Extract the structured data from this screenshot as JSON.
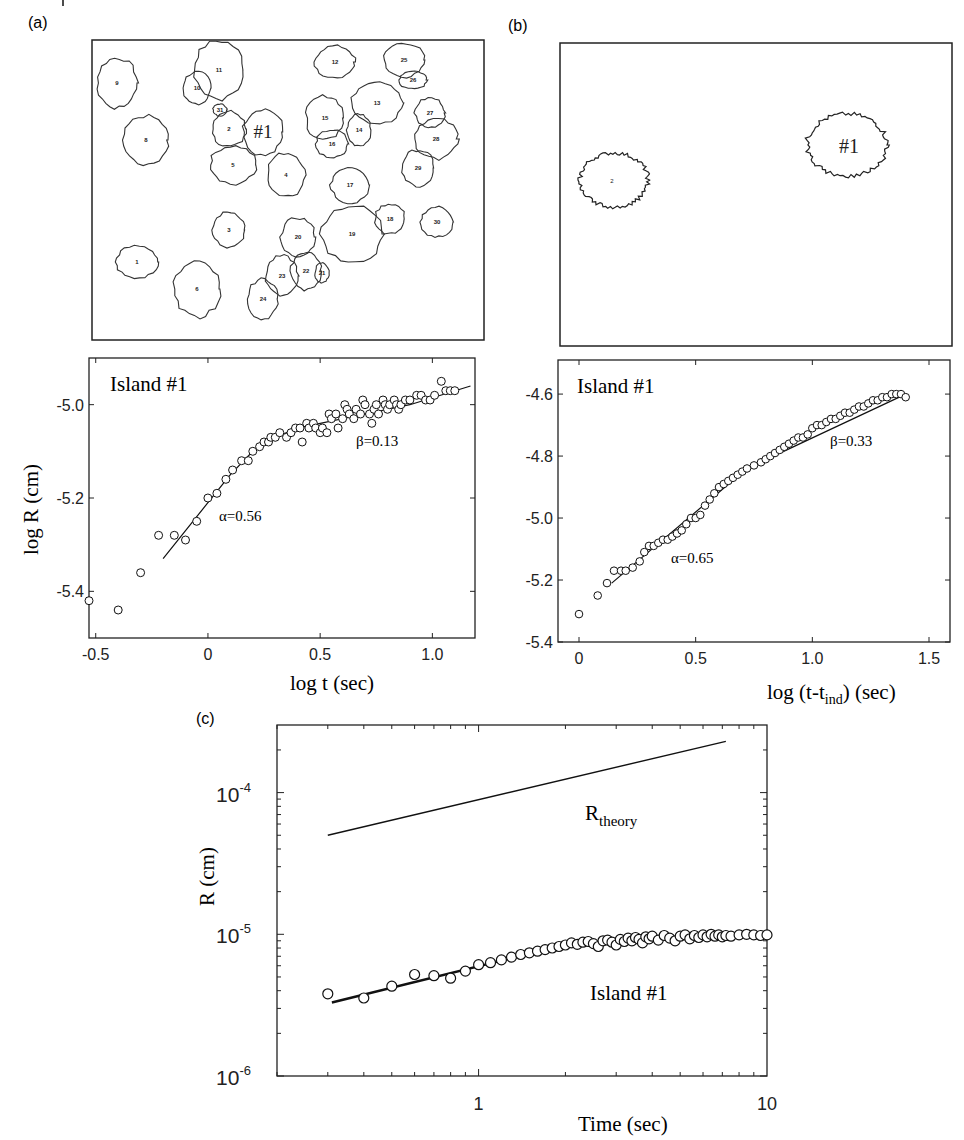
{
  "figure": {
    "panel_labels": [
      "(a)",
      "(b)",
      "(c)"
    ]
  },
  "chart_data": [
    {
      "id": "a-map",
      "type": "diagram",
      "title": "Island outlines (early)",
      "islands": [
        {
          "label": "9"
        },
        {
          "label": "11"
        },
        {
          "label": "10"
        },
        {
          "label": "31"
        },
        {
          "label": "2"
        },
        {
          "label": "#1"
        },
        {
          "label": "8"
        },
        {
          "label": "5"
        },
        {
          "label": "4"
        },
        {
          "label": "12"
        },
        {
          "label": "25"
        },
        {
          "label": "26"
        },
        {
          "label": "15"
        },
        {
          "label": "13"
        },
        {
          "label": "14"
        },
        {
          "label": "16"
        },
        {
          "label": "27"
        },
        {
          "label": "28"
        },
        {
          "label": "29"
        },
        {
          "label": "17"
        },
        {
          "label": "3"
        },
        {
          "label": "20"
        },
        {
          "label": "19"
        },
        {
          "label": "18"
        },
        {
          "label": "30"
        },
        {
          "label": "1"
        },
        {
          "label": "6"
        },
        {
          "label": "23"
        },
        {
          "label": "22"
        },
        {
          "label": "21"
        },
        {
          "label": "24"
        }
      ]
    },
    {
      "id": "b-map",
      "type": "diagram",
      "title": "Island outlines (later)",
      "islands": [
        {
          "label": "2"
        },
        {
          "label": "#1"
        }
      ]
    },
    {
      "id": "a-plot",
      "type": "scatter",
      "annotation": "Island #1",
      "xlabel": "log t (sec)",
      "ylabel": "log R (cm)",
      "xlim": [
        -0.53,
        1.19
      ],
      "ylim": [
        -5.5,
        -4.9
      ],
      "xticks": [
        -0.5,
        0,
        0.5,
        1.0
      ],
      "xtick_labels": [
        "-0.5",
        "0",
        "0.5",
        "1.0"
      ],
      "yticks": [
        -5.0,
        -5.2,
        -5.4
      ],
      "ytick_labels": [
        "-5.0",
        "-5.2",
        "-5.4"
      ],
      "fits": [
        {
          "label": "α=0.56",
          "x": [
            -0.2,
            0.3
          ],
          "y": [
            -5.33,
            -5.07
          ]
        },
        {
          "label": "β=0.13",
          "x": [
            0.3,
            1.17
          ],
          "y": [
            -5.07,
            -4.96
          ]
        }
      ],
      "fit_curve": {
        "x": [
          -0.2,
          0.0,
          0.1,
          0.2,
          0.3,
          0.4,
          0.5,
          0.7,
          0.9,
          1.17
        ],
        "y": [
          -5.33,
          -5.21,
          -5.15,
          -5.1,
          -5.07,
          -5.05,
          -5.04,
          -5.02,
          -5.0,
          -4.96
        ]
      },
      "series": [
        {
          "name": "Island #1",
          "x": [
            -0.53,
            -0.4,
            -0.3,
            -0.22,
            -0.15,
            -0.1,
            -0.05,
            0.0,
            0.04,
            0.08,
            0.11,
            0.15,
            0.18,
            0.2,
            0.23,
            0.25,
            0.27,
            0.28,
            0.3,
            0.32,
            0.35,
            0.37,
            0.39,
            0.41,
            0.42,
            0.44,
            0.45,
            0.47,
            0.48,
            0.5,
            0.51,
            0.53,
            0.54,
            0.55,
            0.57,
            0.58,
            0.6,
            0.61,
            0.62,
            0.63,
            0.65,
            0.66,
            0.68,
            0.69,
            0.7,
            0.72,
            0.73,
            0.74,
            0.75,
            0.76,
            0.78,
            0.79,
            0.8,
            0.81,
            0.83,
            0.84,
            0.85,
            0.86,
            0.88,
            0.9,
            0.93,
            0.95,
            0.97,
            0.99,
            1.01,
            1.04,
            1.06,
            1.08,
            1.1
          ],
          "y": [
            -5.42,
            -5.44,
            -5.36,
            -5.28,
            -5.28,
            -5.29,
            -5.25,
            -5.2,
            -5.19,
            -5.16,
            -5.14,
            -5.12,
            -5.12,
            -5.1,
            -5.09,
            -5.08,
            -5.08,
            -5.07,
            -5.07,
            -5.06,
            -5.07,
            -5.06,
            -5.05,
            -5.05,
            -5.08,
            -5.04,
            -5.05,
            -5.04,
            -5.05,
            -5.06,
            -5.05,
            -5.06,
            -5.02,
            -5.03,
            -5.02,
            -5.05,
            -5.03,
            -5.0,
            -5.01,
            -5.02,
            -5.03,
            -5.01,
            -5.02,
            -4.99,
            -5.0,
            -5.02,
            -5.04,
            -5.01,
            -5.0,
            -5.02,
            -4.99,
            -5.0,
            -5.01,
            -5.0,
            -4.99,
            -5.0,
            -5.01,
            -5.0,
            -4.99,
            -4.99,
            -4.98,
            -4.98,
            -4.99,
            -4.99,
            -4.98,
            -4.95,
            -4.97,
            -4.97,
            -4.97
          ]
        }
      ]
    },
    {
      "id": "b-plot",
      "type": "scatter",
      "annotation": "Island #1",
      "xlabel_main": "log (t-t",
      "xlabel_sub": "ind",
      "xlabel_tail": ") (sec)",
      "xlim": [
        -0.09,
        1.59
      ],
      "ylim": [
        -5.4,
        -4.49
      ],
      "xticks": [
        0,
        0.5,
        1.0,
        1.5
      ],
      "xtick_labels": [
        "0",
        "0.5",
        "1.0",
        "1.5"
      ],
      "yticks": [
        -4.6,
        -4.8,
        -5.0,
        -5.2,
        -5.4
      ],
      "ytick_labels": [
        "-4.6",
        "-4.8",
        "-5.0",
        "-5.2",
        "-5.4"
      ],
      "fits": [
        {
          "label": "α=0.65",
          "x": [
            0.14,
            0.72
          ],
          "y": [
            -5.21,
            -4.84
          ]
        },
        {
          "label": "β=0.33",
          "x": [
            0.72,
            1.4
          ],
          "y": [
            -4.84,
            -4.6
          ]
        }
      ],
      "series": [
        {
          "name": "Island #1",
          "x": [
            0.0,
            0.08,
            0.12,
            0.15,
            0.18,
            0.2,
            0.23,
            0.26,
            0.28,
            0.3,
            0.32,
            0.34,
            0.36,
            0.38,
            0.4,
            0.42,
            0.44,
            0.46,
            0.48,
            0.5,
            0.52,
            0.54,
            0.56,
            0.58,
            0.6,
            0.62,
            0.64,
            0.66,
            0.68,
            0.7,
            0.72,
            0.75,
            0.78,
            0.8,
            0.82,
            0.84,
            0.86,
            0.88,
            0.9,
            0.92,
            0.94,
            0.96,
            0.98,
            1.0,
            1.02,
            1.04,
            1.06,
            1.08,
            1.1,
            1.12,
            1.14,
            1.16,
            1.18,
            1.2,
            1.22,
            1.24,
            1.26,
            1.28,
            1.3,
            1.32,
            1.34,
            1.36,
            1.38,
            1.4
          ],
          "y": [
            -5.31,
            -5.25,
            -5.21,
            -5.17,
            -5.17,
            -5.17,
            -5.16,
            -5.14,
            -5.11,
            -5.09,
            -5.09,
            -5.08,
            -5.07,
            -5.07,
            -5.06,
            -5.05,
            -5.04,
            -5.02,
            -5.0,
            -5.0,
            -4.99,
            -4.96,
            -4.94,
            -4.92,
            -4.9,
            -4.89,
            -4.88,
            -4.87,
            -4.86,
            -4.85,
            -4.84,
            -4.83,
            -4.82,
            -4.81,
            -4.8,
            -4.79,
            -4.78,
            -4.77,
            -4.76,
            -4.75,
            -4.74,
            -4.74,
            -4.73,
            -4.71,
            -4.7,
            -4.7,
            -4.69,
            -4.68,
            -4.68,
            -4.67,
            -4.66,
            -4.66,
            -4.65,
            -4.64,
            -4.64,
            -4.63,
            -4.62,
            -4.62,
            -4.61,
            -4.61,
            -4.6,
            -4.6,
            -4.6,
            -4.61
          ]
        }
      ]
    },
    {
      "id": "c-plot",
      "type": "scatter",
      "xscale": "log",
      "yscale": "log",
      "xlabel": "Time (sec)",
      "ylabel": "R (cm)",
      "xlim": [
        0.2,
        10
      ],
      "ylim": [
        1e-06,
        0.0003
      ],
      "xtick_labels": [
        {
          "v": 1,
          "t": "1"
        },
        {
          "v": 10,
          "t": "10"
        }
      ],
      "ytick_labels": [
        {
          "v": 0.0001,
          "base": "10",
          "exp": "-4"
        },
        {
          "v": 1e-05,
          "base": "10",
          "exp": "-5"
        },
        {
          "v": 1e-06,
          "base": "10",
          "exp": "-6"
        }
      ],
      "theory": {
        "label_main": "R",
        "label_sub": "theory",
        "x": [
          0.3,
          7.2
        ],
        "y": [
          5e-05,
          0.00023
        ]
      },
      "fit": {
        "x": [
          0.31,
          1.8
        ],
        "y": [
          3.3e-06,
          8e-06
        ]
      },
      "annotation": "Island #1",
      "series": [
        {
          "name": "Island #1",
          "x": [
            0.3,
            0.4,
            0.5,
            0.6,
            0.7,
            0.8,
            0.9,
            1.0,
            1.1,
            1.2,
            1.3,
            1.4,
            1.5,
            1.6,
            1.7,
            1.8,
            1.9,
            2.0,
            2.1,
            2.2,
            2.3,
            2.4,
            2.5,
            2.6,
            2.7,
            2.8,
            2.9,
            3.0,
            3.1,
            3.2,
            3.3,
            3.4,
            3.5,
            3.6,
            3.7,
            3.8,
            3.9,
            4.0,
            4.2,
            4.4,
            4.6,
            4.8,
            5.0,
            5.2,
            5.4,
            5.6,
            5.8,
            6.0,
            6.2,
            6.4,
            6.6,
            6.8,
            7.0,
            7.2,
            7.5,
            8.0,
            8.5,
            9.0,
            9.5,
            10.0
          ],
          "y": [
            3.8e-06,
            3.55e-06,
            4.3e-06,
            5.2e-06,
            5.1e-06,
            4.9e-06,
            5.5e-06,
            6.1e-06,
            6.3e-06,
            6.6e-06,
            6.9e-06,
            7.2e-06,
            7.4e-06,
            7.6e-06,
            7.8e-06,
            8e-06,
            8.2e-06,
            8.4e-06,
            8.7e-06,
            8.5e-06,
            8.8e-06,
            8.9e-06,
            8.6e-06,
            8.2e-06,
            9e-06,
            9.1e-06,
            8.8e-06,
            8.4e-06,
            9.2e-06,
            8.9e-06,
            9.4e-06,
            9e-06,
            9.5e-06,
            9.2e-06,
            8.7e-06,
            9.6e-06,
            9.3e-06,
            9.7e-06,
            9.1e-06,
            9.8e-06,
            9.4e-06,
            9e-06,
            9.7e-06,
            9.9e-06,
            9.3e-06,
            9.8e-06,
            9.5e-06,
            9.9e-06,
            9.6e-06,
            1e-05,
            9.7e-06,
            9.9e-06,
            9.6e-06,
            9.8e-06,
            9.7e-06,
            9.9e-06,
            1e-05,
            9.9e-06,
            9.8e-06,
            9.9e-06
          ]
        }
      ]
    }
  ]
}
